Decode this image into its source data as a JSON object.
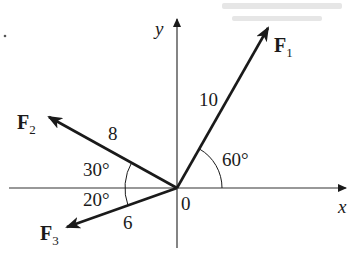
{
  "diagram": {
    "type": "force-vector-diagram",
    "origin_label": "0",
    "axes": {
      "x_label": "x",
      "y_label": "y"
    },
    "vectors": [
      {
        "id": "F1",
        "name": "F",
        "subscript": "1",
        "magnitude": "10",
        "angle_label": "60°",
        "angle_ref": "from positive x-axis"
      },
      {
        "id": "F2",
        "name": "F",
        "subscript": "2",
        "magnitude": "8",
        "angle_label": "30°",
        "angle_ref": "above negative x-axis"
      },
      {
        "id": "F3",
        "name": "F",
        "subscript": "3",
        "magnitude": "6",
        "angle_label": "20°",
        "angle_ref": "below negative x-axis"
      }
    ],
    "colors": {
      "ink": "#1a1a1a",
      "axis": "#333333",
      "background": "#ffffff"
    }
  }
}
